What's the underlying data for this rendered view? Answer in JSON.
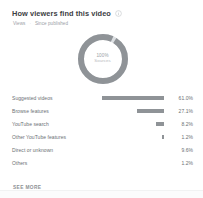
{
  "card": {
    "title": "How viewers find this video",
    "info_icon": "info-icon",
    "subtitle_metric": "Views",
    "subtitle_separator": "·",
    "subtitle_period": "Since published",
    "see_more_label": "SEE MORE"
  },
  "donut": {
    "center_value": "100%",
    "center_label": "Sources",
    "stroke_color": "#8f9397",
    "track_color": "#dcdfe2"
  },
  "chart_data": {
    "type": "pie",
    "title": "How viewers find this video",
    "subtitle": "Views · Since published",
    "unit": "%",
    "legend": "none",
    "categories": [
      "Suggested videos",
      "Browse features",
      "YouTube search",
      "Other YouTube features",
      "Direct or unknown",
      "Others"
    ],
    "values": [
      61.0,
      27.1,
      8.2,
      1.2,
      9.6,
      1.2
    ],
    "labels": [
      "61.0%",
      "27.1%",
      "8.2%",
      "1.2%",
      "9.6%",
      "1.2%"
    ]
  },
  "rows": [
    {
      "label": "Suggested videos",
      "value": "61.0%",
      "bar_pct": 100
    },
    {
      "label": "Browse features",
      "value": "27.1%",
      "bar_pct": 44
    },
    {
      "label": "YouTube search",
      "value": "8.2%",
      "bar_pct": 13
    },
    {
      "label": "Other YouTube features",
      "value": "1.2%",
      "bar_pct": 3
    },
    {
      "label": "Direct or unknown",
      "value": "9.6%",
      "bar_pct": 0
    },
    {
      "label": "Others",
      "value": "1.2%",
      "bar_pct": 0
    }
  ]
}
